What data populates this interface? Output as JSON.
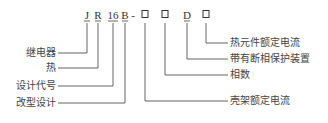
{
  "model_code": {
    "symbols": [
      {
        "text": "J",
        "x": 87,
        "type": "letter"
      },
      {
        "text": "R",
        "x": 98,
        "type": "letter"
      },
      {
        "text": "16",
        "x": 113,
        "type": "letter"
      },
      {
        "text": "B",
        "x": 125,
        "type": "letter"
      },
      {
        "text": "-",
        "x": 133,
        "type": "dash"
      },
      {
        "text": "□",
        "x": 145,
        "type": "box"
      },
      {
        "text": "□",
        "x": 165,
        "type": "box"
      },
      {
        "text": "D",
        "x": 187,
        "type": "letter"
      },
      {
        "text": "□",
        "x": 206,
        "type": "box"
      }
    ]
  },
  "labels_left": [
    {
      "text": "继电器",
      "symbol": "J",
      "y": 53
    },
    {
      "text": "热",
      "symbol": "R",
      "y": 68
    },
    {
      "text": "设计代号",
      "symbol": "16",
      "y": 86
    },
    {
      "text": "改型设计",
      "symbol": "B",
      "y": 103
    }
  ],
  "labels_right": [
    {
      "text": "热元件额定电流",
      "symbol": "□ (3rd)",
      "y": 43
    },
    {
      "text": "带有断相保护装置",
      "symbol": "D",
      "y": 59
    },
    {
      "text": "相数",
      "symbol": "□ (2nd)",
      "y": 75
    },
    {
      "text": "壳架额定电流",
      "symbol": "□ (1st)",
      "y": 101
    }
  ],
  "colors": {
    "line": "#555555",
    "text": "#333333",
    "background": "#ffffff"
  }
}
